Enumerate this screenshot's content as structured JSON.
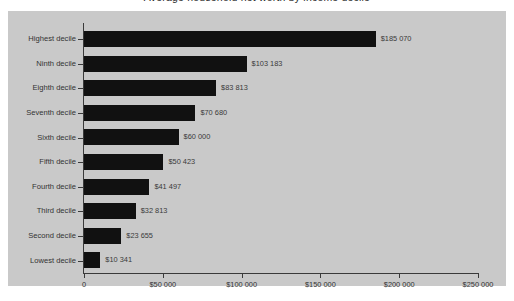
{
  "title": "Average household net worth by income decile",
  "chart_data": {
    "type": "bar",
    "orientation": "horizontal",
    "title": "Average household net worth by income decile",
    "xlabel": "",
    "ylabel": "",
    "xlim": [
      0,
      250000
    ],
    "grid": false,
    "legend": null,
    "plot_background": "#c9c9c9",
    "bar_color": "#111111",
    "categories": [
      "Highest decile",
      "Ninth decile",
      "Eighth decile",
      "Seventh decile",
      "Sixth decile",
      "Fifth decile",
      "Fourth decile",
      "Third decile",
      "Second decile",
      "Lowest decile"
    ],
    "values": [
      185070,
      103183,
      83813,
      70680,
      60000,
      50423,
      41497,
      32813,
      23655,
      10341
    ],
    "data_labels": [
      "$185 070",
      "$103 183",
      "$83 813",
      "$70 680",
      "$60 000",
      "$50 423",
      "$41 497",
      "$32 813",
      "$23 655",
      "$10 341"
    ],
    "xticks": [
      0,
      50000,
      100000,
      150000,
      200000,
      250000
    ],
    "xtick_labels": [
      "0",
      "$50 000",
      "$100 000",
      "$150 000",
      "$200 000",
      "$250 000"
    ]
  }
}
